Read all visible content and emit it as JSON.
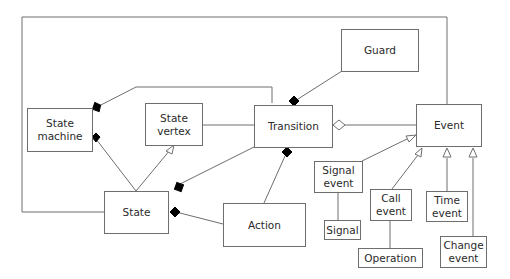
{
  "diagram": {
    "type": "UML class diagram (state machine metamodel)",
    "colors": {
      "line": "#6e6e6e",
      "diamond_filled": "#000000",
      "text": "#2a2a2a"
    },
    "boxes": {
      "state_machine": "State\nmachine",
      "state_vertex": "State\nvertex",
      "transition": "Transition",
      "guard": "Guard",
      "event": "Event",
      "state": "State",
      "action": "Action",
      "signal_event": "Signal\nevent",
      "signal": "Signal",
      "call_event": "Call\nevent",
      "operation": "Operation",
      "time_event": "Time\nevent",
      "change_event": "Change\nevent"
    },
    "relationships": [
      {
        "from": "State machine",
        "to": "Transition",
        "type": "composition"
      },
      {
        "from": "State machine",
        "to": "State",
        "type": "composition"
      },
      {
        "from": "State",
        "to": "State vertex",
        "type": "generalization"
      },
      {
        "from": "State vertex",
        "to": "Transition",
        "type": "association"
      },
      {
        "from": "Transition",
        "to": "Guard",
        "type": "composition"
      },
      {
        "from": "Transition",
        "to": "Event",
        "type": "aggregation"
      },
      {
        "from": "Transition",
        "to": "Action",
        "type": "composition"
      },
      {
        "from": "State",
        "to": "Transition",
        "type": "composition"
      },
      {
        "from": "State",
        "to": "Action",
        "type": "composition"
      },
      {
        "from": "State",
        "to": "Event",
        "type": "association (outer loop)"
      },
      {
        "from": "Signal event",
        "to": "Event",
        "type": "generalization"
      },
      {
        "from": "Call event",
        "to": "Event",
        "type": "generalization"
      },
      {
        "from": "Time event",
        "to": "Event",
        "type": "generalization"
      },
      {
        "from": "Change event",
        "to": "Event",
        "type": "generalization"
      },
      {
        "from": "Signal event",
        "to": "Signal",
        "type": "association"
      },
      {
        "from": "Call event",
        "to": "Operation",
        "type": "association"
      }
    ]
  }
}
